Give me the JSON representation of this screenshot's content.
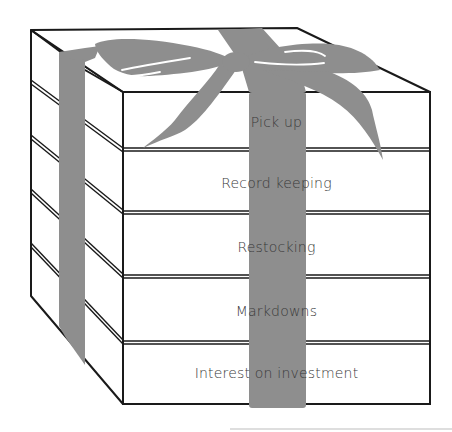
{
  "diagram": {
    "colors": {
      "outline": "#1a1a1a",
      "ribbon": "#8e8e8e",
      "box_face": "#ffffff",
      "text": "#3a3a3a"
    },
    "layers": [
      {
        "label": "Pick up",
        "top": 92,
        "bottom": 149
      },
      {
        "label": "Record keeping",
        "top": 149,
        "bottom": 212
      },
      {
        "label": "Restocking",
        "top": 212,
        "bottom": 276
      },
      {
        "label": "Markdowns",
        "top": 276,
        "bottom": 342
      },
      {
        "label": "Interest on investment",
        "top": 342,
        "bottom": 404
      }
    ]
  }
}
